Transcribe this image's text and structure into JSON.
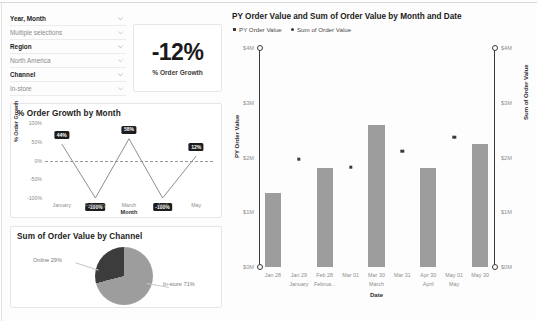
{
  "filters": {
    "rows": [
      {
        "label": "Year, Month",
        "type": "header",
        "icon": "chevron-down-icon"
      },
      {
        "label": "Multiple selections",
        "type": "value",
        "icon": "chevron-down-icon"
      },
      {
        "label": "Region",
        "type": "header",
        "icon": "chevron-down-icon"
      },
      {
        "label": "North America",
        "type": "value",
        "icon": "chevron-down-icon"
      },
      {
        "label": "Channel",
        "type": "header",
        "icon": "chevron-down-icon"
      },
      {
        "label": "In-store",
        "type": "value",
        "icon": "chevron-down-icon"
      }
    ]
  },
  "kpi": {
    "value": "-12%",
    "label": "% Order Growth"
  },
  "line_card": {
    "title": "% Order Growth by Month"
  },
  "pie_card": {
    "title": "Sum of Order Value by Channel"
  },
  "bar_card": {
    "title": "PY Order Value and Sum of Order Value by Month and Date",
    "legend": [
      {
        "name": "PY Order Value",
        "marker": "square"
      },
      {
        "name": "Sum of Order Value",
        "marker": "dot"
      }
    ]
  },
  "colors": {
    "bar": "#9d9d9d",
    "marker": "#3b3b3b",
    "label_bg": "#1d1d1d",
    "pie_online": "#3c3c3c",
    "pie_instore": "#9d9d9d",
    "axis": "#3a3a3a"
  },
  "chart_data": [
    {
      "id": "line",
      "type": "line",
      "title": "% Order Growth by Month",
      "xlabel": "Month",
      "ylabel": "% Order Growth",
      "categories": [
        "January",
        "February",
        "March",
        "April",
        "May"
      ],
      "values": [
        44,
        -100,
        58,
        -100,
        12
      ],
      "data_labels": [
        "44%",
        "-100%",
        "58%",
        "-100%",
        "12%"
      ],
      "ylim": [
        -100,
        100
      ],
      "yticks": [
        100,
        50,
        0,
        -50,
        -100
      ],
      "ytick_labels": [
        "100%",
        "50%",
        "0%",
        "-50%",
        "-100%"
      ],
      "zero_line": true,
      "grid": false
    },
    {
      "id": "pie",
      "type": "pie",
      "title": "Sum of Order Value by Channel",
      "categories": [
        "Online",
        "In-store"
      ],
      "values": [
        29,
        71
      ],
      "data_labels": [
        "Online 29%",
        "In-store 71%"
      ],
      "legend": "callout"
    },
    {
      "id": "bars",
      "type": "bar",
      "title": "PY Order Value and Sum of Order Value by Month and Date",
      "xlabel": "Date",
      "ylabel": "PY Order Value",
      "y2label": "Sum of Order Value",
      "ylim": [
        0,
        4
      ],
      "yticks": [
        0,
        1,
        2,
        3,
        4
      ],
      "ytick_labels": [
        "$0M",
        "$1M",
        "$2M",
        "$3M",
        "$4M"
      ],
      "y2ticks": [
        0,
        1,
        2,
        3,
        4
      ],
      "y2tick_labels": [
        "$0M",
        "$1M",
        "$2M",
        "$3M",
        "$4M"
      ],
      "x": [
        "Jan 28",
        "Jan 29",
        "Feb 28",
        "Mar 01",
        "Mar 30",
        "Mar 31",
        "Apr 30",
        "May 01",
        "May 30"
      ],
      "month_groups": [
        {
          "label": "January",
          "at": "Jan 29"
        },
        {
          "label": "Februa...",
          "at": "Feb 28"
        },
        {
          "label": "March",
          "at": "Mar 30"
        },
        {
          "label": "April",
          "at": "Apr 30"
        },
        {
          "label": "May",
          "at": "May 01"
        }
      ],
      "series": [
        {
          "name": "Sum of Order Value",
          "type": "bar",
          "x": [
            "Jan 28",
            "Feb 28",
            "Mar 30",
            "Apr 30",
            "May 30"
          ],
          "values": [
            1.35,
            1.8,
            2.6,
            1.8,
            2.25
          ]
        },
        {
          "name": "PY Order Value",
          "type": "scatter",
          "x": [
            "Jan 29",
            "Mar 01",
            "Mar 31",
            "May 01"
          ],
          "values": [
            2.0,
            1.85,
            2.15,
            2.4
          ]
        }
      ],
      "grid": false
    }
  ]
}
